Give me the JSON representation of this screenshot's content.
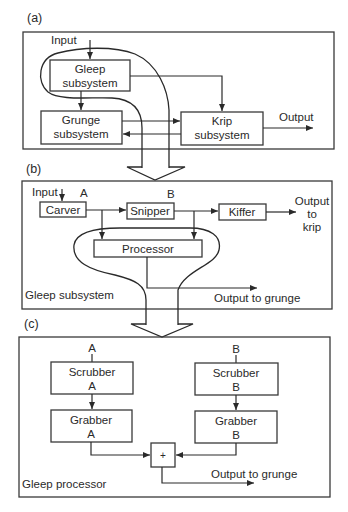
{
  "panel_a": {
    "label": "(a)",
    "input_label": "Input",
    "output_label": "Output",
    "boxes": {
      "gleep": [
        "Gleep",
        "subsystem"
      ],
      "grunge": [
        "Grunge",
        "subsystem"
      ],
      "krip": [
        "Krip",
        "subsystem"
      ]
    }
  },
  "panel_b": {
    "label": "(b)",
    "input_label": "Input",
    "point_a": "A",
    "point_b": "B",
    "boxes": {
      "carver": "Carver",
      "snipper": "Snipper",
      "kiffer": "Kiffer",
      "processor": "Processor"
    },
    "output_krip": [
      "Output",
      "to",
      "krip"
    ],
    "output_grunge": "Output to grunge",
    "caption": "Gleep subsystem"
  },
  "panel_c": {
    "label": "(c)",
    "input_a": "A",
    "input_b": "B",
    "boxes": {
      "scrubber_a": [
        "Scrubber",
        "A"
      ],
      "scrubber_b": [
        "Scrubber",
        "B"
      ],
      "grabber_a": [
        "Grabber",
        "A"
      ],
      "grabber_b": [
        "Grabber",
        "B"
      ],
      "sum": "+"
    },
    "output_grunge": "Output to grunge",
    "caption": "Gleep processor"
  }
}
